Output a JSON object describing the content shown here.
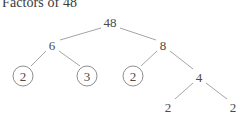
{
  "title": "Factors of 48",
  "colors": {
    "background": "#ffffff",
    "text": "#4a4a4a",
    "title_text": "#3a3a3a",
    "edge_line": "#9a9a9a",
    "circle_stroke": "#8f8f8f"
  },
  "diagram": {
    "type": "factor-tree",
    "root_value": "48",
    "nodes": [
      {
        "id": "n48",
        "label": "48",
        "x": 110,
        "y": 22,
        "circled": false,
        "level": 0
      },
      {
        "id": "n6",
        "label": "6",
        "x": 52,
        "y": 45,
        "circled": false,
        "level": 1
      },
      {
        "id": "n8",
        "label": "8",
        "x": 163,
        "y": 45,
        "circled": false,
        "level": 1
      },
      {
        "id": "n2a",
        "label": "2",
        "x": 23,
        "y": 76,
        "circled": true,
        "level": 2
      },
      {
        "id": "n3",
        "label": "3",
        "x": 87,
        "y": 76,
        "circled": true,
        "level": 2
      },
      {
        "id": "n2b",
        "label": "2",
        "x": 133,
        "y": 76,
        "circled": true,
        "level": 2
      },
      {
        "id": "n4",
        "label": "4",
        "x": 199,
        "y": 77,
        "circled": false,
        "level": 2
      },
      {
        "id": "n2c",
        "label": "2",
        "x": 168,
        "y": 107,
        "circled": false,
        "level": 3
      },
      {
        "id": "n2d",
        "label": "2",
        "x": 233,
        "y": 107,
        "circled": false,
        "level": 3
      }
    ],
    "edges": [
      {
        "from": "n48",
        "to": "n6",
        "x1": 101,
        "y1": 28,
        "x2": 60,
        "y2": 40
      },
      {
        "from": "n48",
        "to": "n8",
        "x1": 120,
        "y1": 28,
        "x2": 156,
        "y2": 40
      },
      {
        "from": "n6",
        "to": "n2a",
        "x1": 46,
        "y1": 51,
        "x2": 31,
        "y2": 66
      },
      {
        "from": "n6",
        "to": "n3",
        "x1": 59,
        "y1": 51,
        "x2": 80,
        "y2": 66
      },
      {
        "from": "n8",
        "to": "n2b",
        "x1": 157,
        "y1": 51,
        "x2": 141,
        "y2": 66
      },
      {
        "from": "n8",
        "to": "n4",
        "x1": 170,
        "y1": 51,
        "x2": 193,
        "y2": 69
      },
      {
        "from": "n4",
        "to": "n2c",
        "x1": 193,
        "y1": 83,
        "x2": 175,
        "y2": 99
      },
      {
        "from": "n4",
        "to": "n2d",
        "x1": 206,
        "y1": 83,
        "x2": 227,
        "y2": 99
      }
    ],
    "circled_meaning": "prime factor"
  }
}
